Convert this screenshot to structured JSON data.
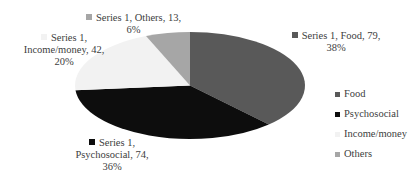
{
  "chart_data": {
    "type": "pie",
    "title": "",
    "series_name": "Series 1",
    "categories": [
      "Food",
      "Psychosocial",
      "Income/money",
      "Others"
    ],
    "values": [
      79,
      74,
      42,
      13
    ],
    "percentages": [
      38,
      36,
      20,
      6
    ],
    "colors": [
      "#595959",
      "#0d0d0d",
      "#f2f2f2",
      "#a6a6a6"
    ],
    "start_angle_deg": 0,
    "direction": "clockwise",
    "legend_position": "right",
    "data_labels": [
      {
        "line1": "Series 1, Food, 79,",
        "line2": "38%",
        "line3": ""
      },
      {
        "line1": "Series 1,",
        "line2": "Psychosocial, 74,",
        "line3": "36%"
      },
      {
        "line1": "Series 1,",
        "line2": "Income/money, 42,",
        "line3": "20%"
      },
      {
        "line1": "Series 1, Others, 13,",
        "line2": "6%",
        "line3": ""
      }
    ]
  },
  "legend": {
    "items": [
      {
        "label": "Food",
        "color": "#595959"
      },
      {
        "label": "Psychosocial",
        "color": "#0d0d0d"
      },
      {
        "label": "Income/money",
        "color": "#f2f2f2"
      },
      {
        "label": "Others",
        "color": "#a6a6a6"
      }
    ]
  }
}
